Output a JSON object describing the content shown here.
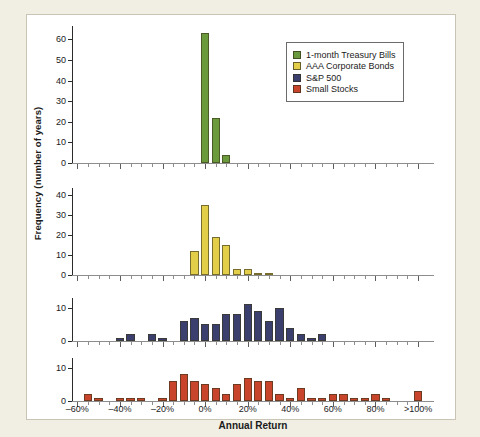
{
  "chart_data": {
    "type": "bar",
    "title": "",
    "xlabel": "Annual Return",
    "ylabel": "Frequency (number of years)",
    "bin_width_percent": 5,
    "x_tick_labels": [
      "–60%",
      "–40%",
      "–20%",
      "0%",
      "20%",
      "40%",
      "60%",
      "80%",
      ">100%"
    ],
    "x_tick_values": [
      -60,
      -40,
      -20,
      0,
      20,
      40,
      60,
      80,
      100
    ],
    "xlim": [
      -62.5,
      107.5
    ],
    "grid": false,
    "legend_position": "top-right",
    "legend": [
      {
        "label": "1-month Treasury Bills",
        "color": "#6a9a3b"
      },
      {
        "label": "AAA Corporate Bonds",
        "color": "#e3ce4a"
      },
      {
        "label": "S&P 500",
        "color": "#3b3f6e"
      },
      {
        "label": "Small Stocks",
        "color": "#c8442a"
      }
    ],
    "panels": [
      {
        "name": "1-month Treasury Bills",
        "color": "#6a9a3b",
        "ylim": [
          0,
          65
        ],
        "y_tick_labels": [
          "0",
          "10",
          "20",
          "30",
          "40",
          "50",
          "60"
        ],
        "y_tick_values": [
          0,
          10,
          20,
          30,
          40,
          50,
          60
        ],
        "bins": [
          {
            "x": 0,
            "value": 63
          },
          {
            "x": 5,
            "value": 22
          },
          {
            "x": 10,
            "value": 4
          }
        ]
      },
      {
        "name": "AAA Corporate Bonds",
        "color": "#e3ce4a",
        "ylim": [
          0,
          42
        ],
        "y_tick_labels": [
          "0",
          "10",
          "20",
          "30",
          "40"
        ],
        "y_tick_values": [
          0,
          10,
          20,
          30,
          40
        ],
        "bins": [
          {
            "x": -5,
            "value": 12
          },
          {
            "x": 0,
            "value": 35
          },
          {
            "x": 5,
            "value": 19
          },
          {
            "x": 10,
            "value": 15
          },
          {
            "x": 15,
            "value": 3
          },
          {
            "x": 20,
            "value": 3
          },
          {
            "x": 25,
            "value": 1
          },
          {
            "x": 30,
            "value": 1
          }
        ]
      },
      {
        "name": "S&P 500",
        "color": "#3b3f6e",
        "ylim": [
          0,
          12
        ],
        "y_tick_labels": [
          "0",
          "10"
        ],
        "y_tick_values": [
          0,
          10
        ],
        "bins": [
          {
            "x": -40,
            "value": 1
          },
          {
            "x": -35,
            "value": 2
          },
          {
            "x": -25,
            "value": 2
          },
          {
            "x": -20,
            "value": 1
          },
          {
            "x": -10,
            "value": 6
          },
          {
            "x": -5,
            "value": 7
          },
          {
            "x": 0,
            "value": 5
          },
          {
            "x": 5,
            "value": 5
          },
          {
            "x": 10,
            "value": 8
          },
          {
            "x": 15,
            "value": 8
          },
          {
            "x": 20,
            "value": 11
          },
          {
            "x": 25,
            "value": 9
          },
          {
            "x": 30,
            "value": 6
          },
          {
            "x": 35,
            "value": 10
          },
          {
            "x": 40,
            "value": 4
          },
          {
            "x": 45,
            "value": 2
          },
          {
            "x": 50,
            "value": 1
          },
          {
            "x": 55,
            "value": 2
          }
        ]
      },
      {
        "name": "Small Stocks",
        "color": "#c8442a",
        "ylim": [
          0,
          12
        ],
        "y_tick_labels": [
          "0",
          "10"
        ],
        "y_tick_values": [
          0,
          10
        ],
        "bins": [
          {
            "x": -55,
            "value": 2
          },
          {
            "x": -50,
            "value": 1
          },
          {
            "x": -40,
            "value": 1
          },
          {
            "x": -35,
            "value": 1
          },
          {
            "x": -30,
            "value": 1
          },
          {
            "x": -20,
            "value": 1
          },
          {
            "x": -15,
            "value": 6
          },
          {
            "x": -10,
            "value": 8
          },
          {
            "x": -5,
            "value": 6
          },
          {
            "x": 0,
            "value": 5
          },
          {
            "x": 5,
            "value": 4
          },
          {
            "x": 10,
            "value": 2
          },
          {
            "x": 15,
            "value": 5
          },
          {
            "x": 20,
            "value": 7
          },
          {
            "x": 25,
            "value": 6
          },
          {
            "x": 30,
            "value": 6
          },
          {
            "x": 35,
            "value": 2
          },
          {
            "x": 40,
            "value": 1
          },
          {
            "x": 45,
            "value": 4
          },
          {
            "x": 50,
            "value": 1
          },
          {
            "x": 55,
            "value": 1
          },
          {
            "x": 60,
            "value": 2
          },
          {
            "x": 65,
            "value": 2
          },
          {
            "x": 70,
            "value": 1
          },
          {
            "x": 75,
            "value": 1
          },
          {
            "x": 80,
            "value": 2
          },
          {
            "x": 85,
            "value": 1
          },
          {
            "x": 100,
            "value": 3
          }
        ]
      }
    ]
  }
}
